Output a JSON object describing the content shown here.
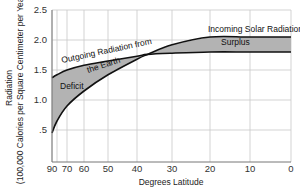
{
  "chart_data": {
    "type": "area",
    "title": "",
    "xlabel": "Degrees Latitude",
    "ylabel_line1": "Radiation",
    "ylabel_line2": "(100,000 Calories per Square Centimeter per Year)",
    "xlim": [
      90,
      0
    ],
    "ylim": [
      0,
      2.5
    ],
    "grid": true,
    "x_ticks": [
      {
        "value": 90,
        "label": "90"
      },
      {
        "value": 80,
        "label": ""
      },
      {
        "value": 70,
        "label": "70"
      },
      {
        "value": 60,
        "label": "60"
      },
      {
        "value": 50,
        "label": "50"
      },
      {
        "value": 40,
        "label": "40"
      },
      {
        "value": 30,
        "label": "30"
      },
      {
        "value": 20,
        "label": "20"
      },
      {
        "value": 10,
        "label": "10"
      },
      {
        "value": 0,
        "label": "0"
      }
    ],
    "y_ticks": [
      {
        "value": 0.5,
        "label": ".5"
      },
      {
        "value": 1.0,
        "label": "1.0"
      },
      {
        "value": 1.5,
        "label": "1.5"
      },
      {
        "value": 2.0,
        "label": "2.0"
      },
      {
        "value": 2.5,
        "label": "2.5"
      }
    ],
    "series": [
      {
        "name": "Incoming Solar Radiation",
        "x": [
          90,
          80,
          70,
          60,
          50,
          40,
          37,
          30,
          20,
          10,
          0
        ],
        "values": [
          0.45,
          0.65,
          0.9,
          1.15,
          1.42,
          1.68,
          1.76,
          1.92,
          2.05,
          2.05,
          2.05
        ]
      },
      {
        "name": "Outgoing Radiation from the Earth",
        "x": [
          90,
          80,
          70,
          60,
          50,
          40,
          37,
          30,
          20,
          10,
          0
        ],
        "values": [
          1.37,
          1.42,
          1.5,
          1.58,
          1.65,
          1.73,
          1.76,
          1.78,
          1.8,
          1.8,
          1.8
        ]
      }
    ],
    "annotations": [
      {
        "text": "Deficit",
        "region": "high latitudes (90°–37°), outgoing exceeds incoming"
      },
      {
        "text": "Surplus",
        "region": "low latitudes (37°–0°), incoming exceeds outgoing"
      },
      {
        "text": "Outgoing Radiation from",
        "line": 1
      },
      {
        "text": "the Earth",
        "line": 2
      },
      {
        "text": "Incoming Solar Radiation"
      }
    ],
    "legend": "none (inline labels)"
  },
  "labels": {
    "deficit": "Deficit",
    "surplus": "Surplus",
    "outgoing_line1": "Outgoing Radiation from",
    "outgoing_line2": "the Earth",
    "incoming": "Incoming Solar Radiation"
  },
  "colors": {
    "fill": "#b3b3b3",
    "curve": "#111111",
    "grid": "#c8c8c8",
    "axis": "#777777"
  }
}
